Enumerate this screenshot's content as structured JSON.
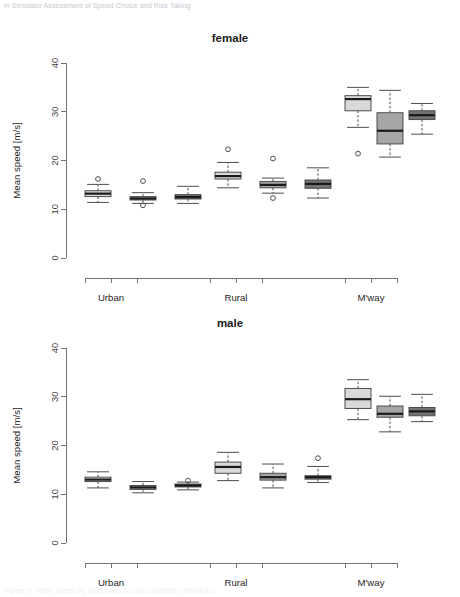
{
  "document": {
    "caption_top": "in Simulator Assessment of Speed Choice and Risk Taking",
    "caption_bottom": "Figure 5: Mean speed by road type, sex and condition (boxplots)."
  },
  "chart_data": [
    {
      "type": "box",
      "title": "female",
      "xlabel": "",
      "ylabel": "Mean speed [m/s]",
      "ylim": [
        0,
        40
      ],
      "yticks": [
        0,
        10,
        20,
        30,
        40
      ],
      "grid": false,
      "legend": "none",
      "categories": [
        "Urban",
        "Rural",
        "M'way"
      ],
      "series": [
        {
          "name": "condition 1",
          "color": "#d9d9d9"
        },
        {
          "name": "condition 2",
          "color": "#a6a6a6"
        },
        {
          "name": "condition 3",
          "color": "#737373"
        }
      ],
      "boxes": [
        {
          "group": "Urban",
          "series": 0,
          "min": 11.4,
          "q1": 12.6,
          "median": 13.2,
          "q3": 13.8,
          "max": 15.1,
          "outliers": [
            16.2
          ]
        },
        {
          "group": "Urban",
          "series": 1,
          "min": 11.2,
          "q1": 11.9,
          "median": 12.2,
          "q3": 12.6,
          "max": 13.4,
          "outliers": [
            15.8,
            10.8
          ]
        },
        {
          "group": "Urban",
          "series": 2,
          "min": 11.2,
          "q1": 12.1,
          "median": 12.5,
          "q3": 13.0,
          "max": 14.7,
          "outliers": []
        },
        {
          "group": "Rural",
          "series": 0,
          "min": 14.4,
          "q1": 16.2,
          "median": 16.8,
          "q3": 17.6,
          "max": 19.6,
          "outliers": [
            22.3
          ]
        },
        {
          "group": "Rural",
          "series": 1,
          "min": 13.3,
          "q1": 14.4,
          "median": 15.0,
          "q3": 15.7,
          "max": 16.4,
          "outliers": [
            20.4,
            12.3
          ]
        },
        {
          "group": "Rural",
          "series": 2,
          "min": 12.3,
          "q1": 14.3,
          "median": 15.2,
          "q3": 16.0,
          "max": 18.5,
          "outliers": []
        },
        {
          "group": "M'way",
          "series": 0,
          "min": 26.8,
          "q1": 30.2,
          "median": 32.6,
          "q3": 33.3,
          "max": 35.0,
          "outliers": [
            21.4
          ]
        },
        {
          "group": "M'way",
          "series": 1,
          "min": 20.7,
          "q1": 23.4,
          "median": 26.1,
          "q3": 29.8,
          "max": 34.4,
          "outliers": []
        },
        {
          "group": "M'way",
          "series": 2,
          "min": 25.4,
          "q1": 28.4,
          "median": 29.3,
          "q3": 30.2,
          "max": 31.7,
          "outliers": []
        }
      ]
    },
    {
      "type": "box",
      "title": "male",
      "xlabel": "",
      "ylabel": "Mean speed [m/s]",
      "ylim": [
        0,
        40
      ],
      "yticks": [
        0,
        10,
        20,
        30,
        40
      ],
      "grid": false,
      "legend": "none",
      "categories": [
        "Urban",
        "Rural",
        "M'way"
      ],
      "series": [
        {
          "name": "condition 1",
          "color": "#d9d9d9"
        },
        {
          "name": "condition 2",
          "color": "#a6a6a6"
        },
        {
          "name": "condition 3",
          "color": "#737373"
        }
      ],
      "boxes": [
        {
          "group": "Urban",
          "series": 0,
          "min": 11.3,
          "q1": 12.6,
          "median": 13.0,
          "q3": 13.5,
          "max": 14.6,
          "outliers": []
        },
        {
          "group": "Urban",
          "series": 1,
          "min": 10.3,
          "q1": 11.0,
          "median": 11.4,
          "q3": 11.8,
          "max": 12.6,
          "outliers": []
        },
        {
          "group": "Urban",
          "series": 2,
          "min": 10.9,
          "q1": 11.5,
          "median": 11.8,
          "q3": 12.1,
          "max": 12.5,
          "outliers": [
            12.8
          ]
        },
        {
          "group": "Rural",
          "series": 0,
          "min": 12.8,
          "q1": 14.3,
          "median": 15.6,
          "q3": 16.6,
          "max": 18.6,
          "outliers": []
        },
        {
          "group": "Rural",
          "series": 1,
          "min": 11.3,
          "q1": 12.9,
          "median": 13.5,
          "q3": 14.3,
          "max": 16.2,
          "outliers": []
        },
        {
          "group": "Rural",
          "series": 2,
          "min": 12.4,
          "q1": 13.1,
          "median": 13.5,
          "q3": 13.8,
          "max": 15.7,
          "outliers": [
            17.4
          ]
        },
        {
          "group": "M'way",
          "series": 0,
          "min": 25.3,
          "q1": 27.6,
          "median": 29.5,
          "q3": 31.7,
          "max": 33.5,
          "outliers": []
        },
        {
          "group": "M'way",
          "series": 1,
          "min": 22.8,
          "q1": 25.8,
          "median": 26.5,
          "q3": 28.1,
          "max": 30.1,
          "outliers": []
        },
        {
          "group": "M'way",
          "series": 2,
          "min": 24.9,
          "q1": 26.1,
          "median": 27.0,
          "q3": 27.8,
          "max": 30.5,
          "outliers": []
        }
      ]
    }
  ],
  "layout": {
    "plot_left": 66,
    "plot_right": 440,
    "plot_top": 43,
    "plot_bottom": 238,
    "axis_x_y": 258,
    "group_label_y": 281,
    "title_y": 14,
    "box_width": 26,
    "box_slots_x": [
      98,
      143,
      188,
      228,
      273,
      318,
      358,
      390,
      422
    ],
    "tick_x": [
      85,
      111,
      137,
      210,
      236,
      262,
      345,
      371,
      397
    ]
  }
}
